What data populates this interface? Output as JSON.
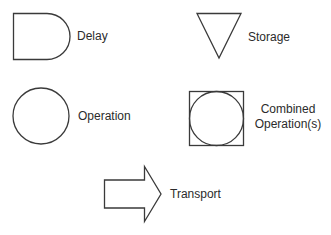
{
  "diagram": {
    "symbols": [
      {
        "id": "delay",
        "label": "Delay",
        "shape": "d-shape"
      },
      {
        "id": "storage",
        "label": "Storage",
        "shape": "inverted-triangle"
      },
      {
        "id": "operation",
        "label": "Operation",
        "shape": "circle"
      },
      {
        "id": "combined",
        "label_line1": "Combined",
        "label_line2": "Operation(s)",
        "shape": "circle-in-square"
      },
      {
        "id": "transport",
        "label": "Transport",
        "shape": "block-arrow"
      }
    ],
    "stroke_color": "#3a3a3a",
    "text_color": "#2b2b2b"
  }
}
